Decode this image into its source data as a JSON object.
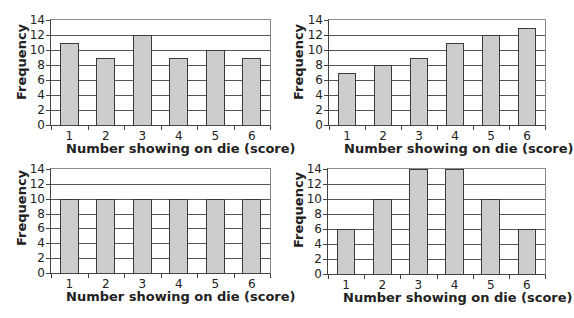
{
  "chart_data": [
    {
      "type": "bar",
      "position": "top-left",
      "title": "",
      "xlabel": "Number showing on die (score)",
      "ylabel": "Frequency",
      "categories": [
        "1",
        "2",
        "3",
        "4",
        "5",
        "6"
      ],
      "values": [
        11,
        9,
        12,
        9,
        10,
        9
      ],
      "yticks": [
        "0",
        "2",
        "4",
        "6",
        "8",
        "10",
        "12",
        "14"
      ],
      "ylim": [
        0,
        14
      ],
      "grid": true,
      "bar_color": "#cdcdcd",
      "bar_edge_color": "#3a3a3a"
    },
    {
      "type": "bar",
      "position": "top-right",
      "title": "",
      "xlabel": "Number showing on die (score)",
      "ylabel": "Frequency",
      "categories": [
        "1",
        "2",
        "3",
        "4",
        "5",
        "6"
      ],
      "values": [
        7,
        8,
        9,
        11,
        12,
        13
      ],
      "yticks": [
        "0",
        "2",
        "4",
        "6",
        "8",
        "10",
        "12",
        "14"
      ],
      "ylim": [
        0,
        14
      ],
      "grid": true,
      "bar_color": "#cdcdcd",
      "bar_edge_color": "#3a3a3a"
    },
    {
      "type": "bar",
      "position": "bottom-left",
      "title": "",
      "xlabel": "Number showing on die (score)",
      "ylabel": "Frequency",
      "categories": [
        "1",
        "2",
        "3",
        "4",
        "5",
        "6"
      ],
      "values": [
        10,
        10,
        10,
        10,
        10,
        10
      ],
      "yticks": [
        "0",
        "2",
        "4",
        "6",
        "8",
        "10",
        "12",
        "14"
      ],
      "ylim": [
        0,
        14
      ],
      "grid": true,
      "bar_color": "#cdcdcd",
      "bar_edge_color": "#3a3a3a"
    },
    {
      "type": "bar",
      "position": "bottom-right",
      "title": "",
      "xlabel": "Number showing on die (score)",
      "ylabel": "Frequency",
      "categories": [
        "1",
        "2",
        "3",
        "4",
        "5",
        "6"
      ],
      "values": [
        6,
        10,
        14,
        14,
        10,
        6
      ],
      "yticks": [
        "0",
        "2",
        "4",
        "6",
        "8",
        "10",
        "12",
        "14"
      ],
      "ylim": [
        0,
        14
      ],
      "grid": true,
      "bar_color": "#cdcdcd",
      "bar_edge_color": "#3a3a3a"
    }
  ]
}
